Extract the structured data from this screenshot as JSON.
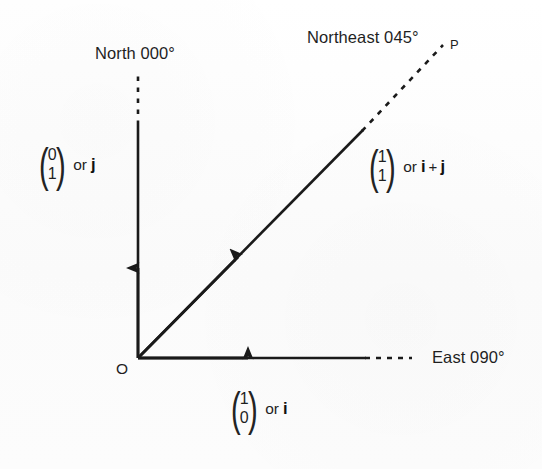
{
  "diagram": {
    "background_color": "#fdfdfd",
    "ink_color": "#1f1f1f",
    "origin_label": "O",
    "point_label": "P",
    "labels": {
      "north": "North 000°",
      "northeast": "Northeast 045°",
      "east": "East 090°"
    },
    "vectors": [
      {
        "name": "j",
        "top": "0",
        "bottom": "1",
        "or": "or",
        "basis": "j",
        "plus": "",
        "basis2": ""
      },
      {
        "name": "i-plus-j",
        "top": "1",
        "bottom": "1",
        "or": "or",
        "basis": "i",
        "plus": "+",
        "basis2": "j"
      },
      {
        "name": "i",
        "top": "1",
        "bottom": "0",
        "or": "or",
        "basis": "i",
        "plus": "",
        "basis2": ""
      }
    ],
    "geometry": {
      "origin_x": 138,
      "origin_y": 358,
      "vertical_solid_top": 125,
      "vertical_dash_top": 70,
      "horizontal_solid_right": 365,
      "horizontal_dash_right": 412,
      "diagonal_solid_end_x": 362,
      "diagonal_solid_end_y": 131,
      "diagonal_dash_end_x": 443,
      "diagonal_dash_end_y": 45
    }
  }
}
